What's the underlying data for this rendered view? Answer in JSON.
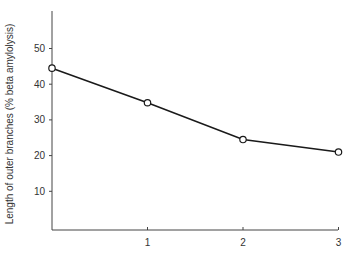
{
  "chart_data": {
    "type": "line",
    "title": "",
    "xlabel": "",
    "ylabel": "Length of outer branches (% beta amylolysis)",
    "x": [
      0,
      1,
      2,
      3
    ],
    "xticks": [
      "1",
      "2",
      "3"
    ],
    "yticks": [
      "10",
      "20",
      "30",
      "40",
      "50"
    ],
    "xlim": [
      0,
      3
    ],
    "ylim": [
      0,
      59
    ],
    "grid": false,
    "legend": null,
    "series": [
      {
        "name": "outer branch length",
        "values": [
          44.5,
          34.8,
          24.5,
          21.0
        ],
        "marker": "open-circle",
        "color": "#1a1a1a"
      }
    ]
  }
}
